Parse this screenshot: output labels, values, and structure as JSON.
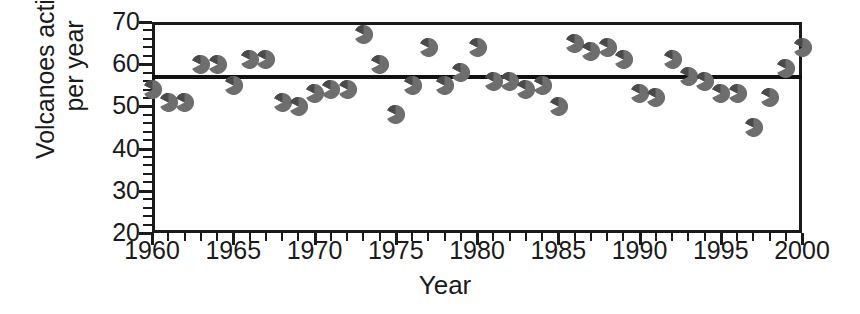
{
  "chart_data": {
    "type": "scatter",
    "title": "",
    "xlabel": "Year",
    "ylabel": "Volcanoes active per year",
    "ylabel_lines": [
      "Volcanoes active",
      "per year"
    ],
    "xlim": [
      1960,
      2000
    ],
    "ylim": [
      20,
      70
    ],
    "xticks": [
      1960,
      1965,
      1970,
      1975,
      1980,
      1985,
      1990,
      1995,
      2000
    ],
    "yticks": [
      20,
      30,
      40,
      50,
      60,
      70
    ],
    "x_minor_step": 1,
    "y_minor_step": 2,
    "grid": false,
    "legend": false,
    "series_name": "Volcanoes active per year",
    "marker": "split-circle",
    "marker_color": "#6e6e6e",
    "reference_line": {
      "type": "horizontal-mean",
      "value": 57,
      "color": "#111111",
      "label": ""
    },
    "x": [
      1960,
      1961,
      1962,
      1963,
      1964,
      1965,
      1966,
      1967,
      1968,
      1969,
      1970,
      1971,
      1972,
      1973,
      1974,
      1975,
      1976,
      1977,
      1978,
      1979,
      1980,
      1981,
      1982,
      1983,
      1984,
      1985,
      1986,
      1987,
      1988,
      1989,
      1990,
      1991,
      1992,
      1993,
      1994,
      1995,
      1996,
      1997,
      1998,
      1999,
      2000
    ],
    "y": [
      54,
      51,
      51,
      60,
      60,
      55,
      61,
      61,
      51,
      50,
      53,
      54,
      54,
      67,
      60,
      48,
      55,
      64,
      55,
      58,
      64,
      56,
      56,
      54,
      55,
      50,
      65,
      63,
      64,
      61,
      53,
      52,
      61,
      57,
      56,
      53,
      53,
      45,
      52,
      59,
      64
    ],
    "points": [
      {
        "year": 1960,
        "value": 54
      },
      {
        "year": 1961,
        "value": 51
      },
      {
        "year": 1962,
        "value": 51
      },
      {
        "year": 1963,
        "value": 60
      },
      {
        "year": 1964,
        "value": 60
      },
      {
        "year": 1965,
        "value": 55
      },
      {
        "year": 1966,
        "value": 61
      },
      {
        "year": 1967,
        "value": 61
      },
      {
        "year": 1968,
        "value": 51
      },
      {
        "year": 1969,
        "value": 50
      },
      {
        "year": 1970,
        "value": 53
      },
      {
        "year": 1971,
        "value": 54
      },
      {
        "year": 1972,
        "value": 54
      },
      {
        "year": 1973,
        "value": 67
      },
      {
        "year": 1974,
        "value": 60
      },
      {
        "year": 1975,
        "value": 48
      },
      {
        "year": 1976,
        "value": 55
      },
      {
        "year": 1977,
        "value": 64
      },
      {
        "year": 1978,
        "value": 55
      },
      {
        "year": 1979,
        "value": 58
      },
      {
        "year": 1980,
        "value": 64
      },
      {
        "year": 1981,
        "value": 56
      },
      {
        "year": 1982,
        "value": 56
      },
      {
        "year": 1983,
        "value": 54
      },
      {
        "year": 1984,
        "value": 55
      },
      {
        "year": 1985,
        "value": 50
      },
      {
        "year": 1986,
        "value": 65
      },
      {
        "year": 1987,
        "value": 63
      },
      {
        "year": 1988,
        "value": 64
      },
      {
        "year": 1989,
        "value": 61
      },
      {
        "year": 1990,
        "value": 53
      },
      {
        "year": 1991,
        "value": 52
      },
      {
        "year": 1992,
        "value": 61
      },
      {
        "year": 1993,
        "value": 57
      },
      {
        "year": 1994,
        "value": 56
      },
      {
        "year": 1995,
        "value": 53
      },
      {
        "year": 1996,
        "value": 53
      },
      {
        "year": 1997,
        "value": 45
      },
      {
        "year": 1998,
        "value": 52
      },
      {
        "year": 1999,
        "value": 59
      },
      {
        "year": 2000,
        "value": 64
      }
    ]
  },
  "axes": {
    "x_tick_labels": [
      "1960",
      "1965",
      "1970",
      "1975",
      "1980",
      "1985",
      "1990",
      "1995",
      "2000"
    ],
    "y_tick_labels": [
      "70",
      "60",
      "50",
      "40",
      "30",
      "20"
    ],
    "x_title": "Year",
    "y_title_line1": "Volcanoes active",
    "y_title_line2": "per year"
  },
  "colors": {
    "axis": "#1a1a1a",
    "marker": "#6e6e6e",
    "marker_dark": "#4a4a4a",
    "mean_line": "#111111",
    "background": "#ffffff"
  }
}
